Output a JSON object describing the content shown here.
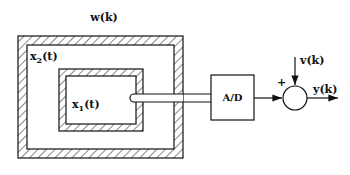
{
  "diagram": {
    "labels": {
      "disturbance": "w(k)",
      "outer_state": "x",
      "outer_state_sub": "2",
      "outer_state_arg": "(t)",
      "inner_state": "x",
      "inner_state_sub": "1",
      "inner_state_arg": "(t)",
      "converter": "A/D",
      "noise": "v(k)",
      "plus_sign": "+",
      "output": "y(k)"
    },
    "blocks": [
      {
        "id": "outer-region",
        "type": "hatched-box",
        "state": "x2(t)"
      },
      {
        "id": "inner-region",
        "type": "hatched-box",
        "state": "x1(t)"
      },
      {
        "id": "sensor-probe",
        "type": "probe"
      },
      {
        "id": "ad-converter",
        "type": "box",
        "label": "A/D"
      },
      {
        "id": "summing-junction",
        "type": "circle",
        "inputs": [
          "A/D output (+)",
          "v(k)"
        ],
        "output": "y(k)"
      }
    ],
    "colors": {
      "stroke": "#111111",
      "background": "#ffffff"
    }
  }
}
